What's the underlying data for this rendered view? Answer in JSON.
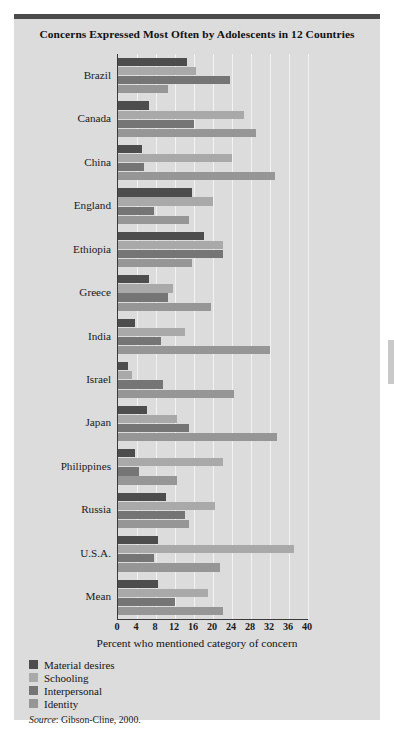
{
  "figure": {
    "title": "Concerns Expressed Most Often by Adolescents in 12 Countries",
    "source_prefix": "Source",
    "source_text": ": Gibson-Cline, 2000."
  },
  "chart_data": {
    "type": "bar",
    "orientation": "horizontal",
    "title": "Concerns Expressed Most Often by Adolescents in 12 Countries",
    "xlabel": "Percent who mentioned category of concern",
    "ylabel": "",
    "xlim": [
      0,
      40
    ],
    "xticks": [
      0,
      4,
      8,
      12,
      16,
      20,
      24,
      28,
      32,
      36,
      40
    ],
    "grid": true,
    "legend_position": "below-left",
    "categories": [
      "Brazil",
      "Canada",
      "China",
      "England",
      "Ethiopia",
      "Greece",
      "India",
      "Israel",
      "Japan",
      "Philippines",
      "Russia",
      "U.S.A.",
      "Mean"
    ],
    "series": [
      {
        "name": "Material desires",
        "color": "#4d4d4d",
        "values": [
          14.5,
          6.5,
          5.0,
          15.5,
          18.0,
          6.5,
          3.5,
          2.0,
          6.0,
          3.5,
          10.0,
          8.5,
          8.5
        ]
      },
      {
        "name": "Schooling",
        "color": "#a9a9a9",
        "values": [
          16.5,
          26.5,
          24.0,
          20.0,
          22.0,
          11.5,
          14.0,
          3.0,
          12.5,
          22.0,
          20.5,
          37.0,
          19.0
        ]
      },
      {
        "name": "Interpersonal",
        "color": "#757575",
        "values": [
          23.5,
          16.0,
          5.5,
          7.5,
          22.0,
          10.5,
          9.0,
          9.5,
          15.0,
          4.5,
          14.0,
          7.5,
          12.0
        ]
      },
      {
        "name": "Identity",
        "color": "#969696",
        "values": [
          10.5,
          29.0,
          33.0,
          15.0,
          15.5,
          19.5,
          32.0,
          24.5,
          33.5,
          12.5,
          15.0,
          21.5,
          22.0
        ]
      }
    ]
  }
}
